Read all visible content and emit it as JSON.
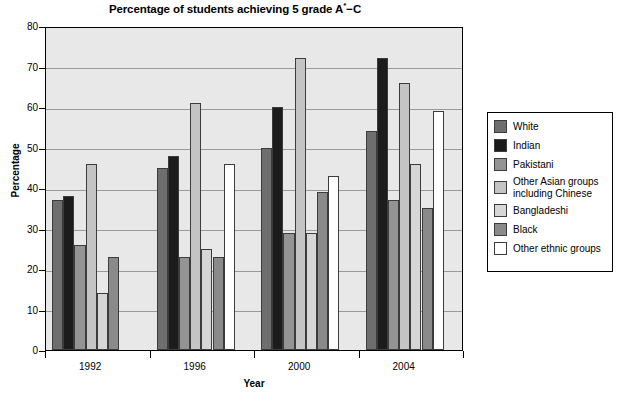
{
  "chart_data": {
    "type": "bar",
    "title": "Percentage of students achieving 5 grade A*−C",
    "title_prefix": "Percentage of students achieving 5 grade A",
    "title_sup": "*",
    "title_suffix": "−C",
    "xlabel": "Year",
    "ylabel": "Percentage",
    "categories": [
      "1992",
      "1996",
      "2000",
      "2004"
    ],
    "ylim": [
      0,
      80
    ],
    "yticks": [
      0,
      10,
      20,
      30,
      40,
      50,
      60,
      70,
      80
    ],
    "ytick_labels": [
      "0",
      "10",
      "20",
      "30",
      "40",
      "50",
      "60",
      "70",
      "80"
    ],
    "grid": true,
    "legend_position": "right",
    "series": [
      {
        "name": "White",
        "color": "#6e6e6e",
        "values": [
          37,
          45,
          50,
          54
        ]
      },
      {
        "name": "Indian",
        "color": "#1c1c1c",
        "values": [
          38,
          48,
          60,
          72
        ]
      },
      {
        "name": "Pakistani",
        "color": "#949494",
        "values": [
          26,
          23,
          29,
          37
        ]
      },
      {
        "name": "Other Asian groups\nincluding Chinese",
        "color": "#c4c4c4",
        "values": [
          46,
          61,
          72,
          66
        ]
      },
      {
        "name": "Bangladeshi",
        "color": "#d6d6d6",
        "values": [
          14,
          25,
          29,
          46
        ]
      },
      {
        "name": "Black",
        "color": "#8a8a8a",
        "values": [
          23,
          23,
          39,
          35
        ]
      },
      {
        "name": "Other ethnic groups",
        "color": "#ffffff",
        "values": [
          null,
          46,
          43,
          59
        ]
      }
    ]
  },
  "legend": {
    "items": [
      {
        "label": "White"
      },
      {
        "label": "Indian"
      },
      {
        "label": "Pakistani"
      },
      {
        "label": "Other Asian groups\nincluding Chinese"
      },
      {
        "label": "Bangladeshi"
      },
      {
        "label": "Black"
      },
      {
        "label": "Other ethnic groups"
      }
    ]
  }
}
